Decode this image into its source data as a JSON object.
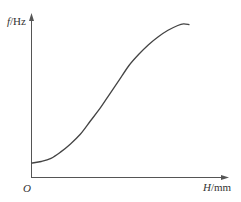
{
  "chart_data": {
    "type": "line",
    "title": "",
    "xlabel": "H/mm",
    "ylabel": "f/Hz",
    "x_var": "H",
    "x_unit": "/mm",
    "y_var": "f",
    "y_unit": "/Hz",
    "origin_label": "O",
    "grid": false,
    "legend": null,
    "ticks": "none",
    "series": [
      {
        "name": "f(H)",
        "color": "#444444",
        "points_normalized": [
          [
            0.0,
            0.09
          ],
          [
            0.05,
            0.1
          ],
          [
            0.1,
            0.12
          ],
          [
            0.15,
            0.16
          ],
          [
            0.2,
            0.21
          ],
          [
            0.25,
            0.27
          ],
          [
            0.3,
            0.35
          ],
          [
            0.35,
            0.43
          ],
          [
            0.4,
            0.52
          ],
          [
            0.45,
            0.61
          ],
          [
            0.5,
            0.7
          ],
          [
            0.55,
            0.77
          ],
          [
            0.6,
            0.83
          ],
          [
            0.65,
            0.88
          ],
          [
            0.7,
            0.92
          ],
          [
            0.75,
            0.95
          ],
          [
            0.78,
            0.96
          ],
          [
            0.81,
            0.955
          ]
        ]
      }
    ],
    "axis_colors": {
      "axis": "#555555",
      "curve": "#444444"
    }
  },
  "labels": {
    "y_axis_var": "f",
    "y_axis_unit": "/Hz",
    "x_axis_var": "H",
    "x_axis_unit": "/mm",
    "origin": "O"
  }
}
